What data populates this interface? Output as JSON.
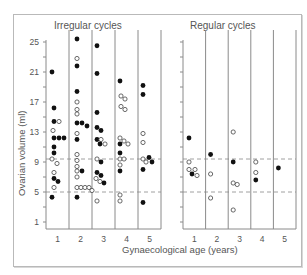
{
  "chart_data": {
    "type": "scatter",
    "ylabel": "Ovarian volume (ml)",
    "xlabel": "Gynaecological age (years)",
    "yticks": [
      1,
      5,
      9,
      13,
      17,
      21,
      25
    ],
    "ylim": [
      0,
      26
    ],
    "xticks": [
      1,
      2,
      3,
      4,
      5
    ],
    "reference_lines": [
      5,
      9.4
    ],
    "legend": {
      "filled": "filled circle",
      "open": "open circle"
    },
    "panels": [
      {
        "title": "Irregular cycles",
        "points": [
          {
            "x": 1,
            "dx": -3,
            "y": 21,
            "f": true
          },
          {
            "x": 1,
            "dx": -1,
            "y": 16.2,
            "f": true
          },
          {
            "x": 1,
            "dx": -1,
            "y": 14.4,
            "f": true
          },
          {
            "x": 1,
            "dx": 4,
            "y": 14.4,
            "f": false
          },
          {
            "x": 1,
            "dx": -2,
            "y": 13.2,
            "f": false
          },
          {
            "x": 1,
            "dx": -1,
            "y": 12.2,
            "f": true
          },
          {
            "x": 1,
            "dx": 4,
            "y": 12.2,
            "f": true
          },
          {
            "x": 1,
            "dx": 9,
            "y": 12.2,
            "f": true
          },
          {
            "x": 1,
            "dx": -1,
            "y": 11,
            "f": true
          },
          {
            "x": 1,
            "dx": -1,
            "y": 10.2,
            "f": true
          },
          {
            "x": 1,
            "dx": -3,
            "y": 9.4,
            "f": false
          },
          {
            "x": 1,
            "dx": 2,
            "y": 8.8,
            "f": false
          },
          {
            "x": 1,
            "dx": -1,
            "y": 7.6,
            "f": false
          },
          {
            "x": 1,
            "dx": -1,
            "y": 6.8,
            "f": true
          },
          {
            "x": 1,
            "dx": 3,
            "y": 6.4,
            "f": true
          },
          {
            "x": 1,
            "dx": -1,
            "y": 5.6,
            "f": false
          },
          {
            "x": 1,
            "dx": -3,
            "y": 4.3,
            "f": true
          },
          {
            "x": 2,
            "dx": -1,
            "y": 25.4,
            "f": true
          },
          {
            "x": 2,
            "dx": -1,
            "y": 22.8,
            "f": false
          },
          {
            "x": 2,
            "dx": -1,
            "y": 21.8,
            "f": true
          },
          {
            "x": 2,
            "dx": -1,
            "y": 18.4,
            "f": true
          },
          {
            "x": 2,
            "dx": -1,
            "y": 17,
            "f": false
          },
          {
            "x": 2,
            "dx": -1,
            "y": 16,
            "f": false
          },
          {
            "x": 2,
            "dx": -1,
            "y": 15.4,
            "f": false
          },
          {
            "x": 2,
            "dx": -1,
            "y": 14.2,
            "f": true
          },
          {
            "x": 2,
            "dx": 4,
            "y": 14.2,
            "f": true
          },
          {
            "x": 2,
            "dx": 9,
            "y": 13.8,
            "f": true
          },
          {
            "x": 2,
            "dx": -1,
            "y": 12.8,
            "f": false
          },
          {
            "x": 2,
            "dx": -1,
            "y": 12,
            "f": true
          },
          {
            "x": 2,
            "dx": -1,
            "y": 10,
            "f": false
          },
          {
            "x": 2,
            "dx": -1,
            "y": 9.2,
            "f": false
          },
          {
            "x": 2,
            "dx": -1,
            "y": 8.4,
            "f": false
          },
          {
            "x": 2,
            "dx": -1,
            "y": 7.8,
            "f": false
          },
          {
            "x": 2,
            "dx": 4,
            "y": 7.8,
            "f": true
          },
          {
            "x": 2,
            "dx": -1,
            "y": 7,
            "f": false
          },
          {
            "x": 2,
            "dx": -1,
            "y": 5.6,
            "f": false
          },
          {
            "x": 2,
            "dx": 3,
            "y": 5.6,
            "f": false
          },
          {
            "x": 2,
            "dx": 7,
            "y": 5.6,
            "f": false
          },
          {
            "x": 2,
            "dx": 11,
            "y": 5.6,
            "f": false
          },
          {
            "x": 2,
            "dx": 14,
            "y": 5.2,
            "f": false
          },
          {
            "x": 2,
            "dx": -1,
            "y": 4.3,
            "f": true
          },
          {
            "x": 3,
            "dx": -4,
            "y": 24.5,
            "f": true
          },
          {
            "x": 3,
            "dx": -4,
            "y": 20.8,
            "f": true
          },
          {
            "x": 3,
            "dx": -4,
            "y": 15.6,
            "f": true
          },
          {
            "x": 3,
            "dx": -4,
            "y": 13.6,
            "f": true
          },
          {
            "x": 3,
            "dx": 0,
            "y": 13.2,
            "f": true
          },
          {
            "x": 3,
            "dx": -4,
            "y": 12,
            "f": true
          },
          {
            "x": 3,
            "dx": 0,
            "y": 12,
            "f": false
          },
          {
            "x": 3,
            "dx": -1,
            "y": 11.4,
            "f": true
          },
          {
            "x": 3,
            "dx": 4,
            "y": 11.4,
            "f": false
          },
          {
            "x": 3,
            "dx": -4,
            "y": 9.4,
            "f": false
          },
          {
            "x": 3,
            "dx": 0,
            "y": 9,
            "f": true
          },
          {
            "x": 3,
            "dx": -4,
            "y": 7.6,
            "f": true
          },
          {
            "x": 3,
            "dx": 0,
            "y": 7.2,
            "f": true
          },
          {
            "x": 3,
            "dx": -5,
            "y": 6.8,
            "f": false
          },
          {
            "x": 3,
            "dx": -1,
            "y": 6.4,
            "f": false
          },
          {
            "x": 3,
            "dx": 3,
            "y": 6.2,
            "f": true
          },
          {
            "x": 3,
            "dx": -4,
            "y": 3.8,
            "f": false
          },
          {
            "x": 4,
            "dx": -4,
            "y": 19.8,
            "f": true
          },
          {
            "x": 4,
            "dx": -3,
            "y": 17.8,
            "f": false
          },
          {
            "x": 4,
            "dx": 1,
            "y": 17.4,
            "f": false
          },
          {
            "x": 4,
            "dx": -3,
            "y": 16.4,
            "f": false
          },
          {
            "x": 4,
            "dx": 1,
            "y": 16,
            "f": false
          },
          {
            "x": 4,
            "dx": -4,
            "y": 12.2,
            "f": false
          },
          {
            "x": 4,
            "dx": -4,
            "y": 11.4,
            "f": true
          },
          {
            "x": 4,
            "dx": 0,
            "y": 11.8,
            "f": false
          },
          {
            "x": 4,
            "dx": 4,
            "y": 11.4,
            "f": false
          },
          {
            "x": 4,
            "dx": -4,
            "y": 10.2,
            "f": true
          },
          {
            "x": 4,
            "dx": -4,
            "y": 9.4,
            "f": false
          },
          {
            "x": 4,
            "dx": 0,
            "y": 9.4,
            "f": false
          },
          {
            "x": 4,
            "dx": -4,
            "y": 8.6,
            "f": false
          },
          {
            "x": 4,
            "dx": -4,
            "y": 7.8,
            "f": true
          },
          {
            "x": 4,
            "dx": -4,
            "y": 4.6,
            "f": false
          },
          {
            "x": 4,
            "dx": -4,
            "y": 3.8,
            "f": false
          },
          {
            "x": 5,
            "dx": -4,
            "y": 19.2,
            "f": true
          },
          {
            "x": 5,
            "dx": -4,
            "y": 18,
            "f": true
          },
          {
            "x": 5,
            "dx": -4,
            "y": 12.8,
            "f": false
          },
          {
            "x": 5,
            "dx": -4,
            "y": 11.6,
            "f": false
          },
          {
            "x": 5,
            "dx": -4,
            "y": 9.4,
            "f": false
          },
          {
            "x": 5,
            "dx": -1,
            "y": 9,
            "f": false
          },
          {
            "x": 5,
            "dx": 2,
            "y": 9.6,
            "f": true
          },
          {
            "x": 5,
            "dx": 5,
            "y": 9,
            "f": true
          },
          {
            "x": 5,
            "dx": -4,
            "y": 8,
            "f": true
          },
          {
            "x": 5,
            "dx": -4,
            "y": 3.6,
            "f": true
          }
        ]
      },
      {
        "title": "Regular cycles",
        "points": [
          {
            "x": 1,
            "dx": -3,
            "y": 12.2,
            "f": true
          },
          {
            "x": 1,
            "dx": -3,
            "y": 9,
            "f": false
          },
          {
            "x": 1,
            "dx": -3,
            "y": 8,
            "f": false
          },
          {
            "x": 1,
            "dx": 3,
            "y": 8,
            "f": false
          },
          {
            "x": 1,
            "dx": 0,
            "y": 7.4,
            "f": true
          },
          {
            "x": 1,
            "dx": 5,
            "y": 7.2,
            "f": false
          },
          {
            "x": 2,
            "dx": -4,
            "y": 10,
            "f": true
          },
          {
            "x": 2,
            "dx": -4,
            "y": 7.4,
            "f": false
          },
          {
            "x": 2,
            "dx": -4,
            "y": 4.2,
            "f": false
          },
          {
            "x": 3,
            "dx": -4,
            "y": 13,
            "f": false
          },
          {
            "x": 3,
            "dx": -4,
            "y": 9,
            "f": true
          },
          {
            "x": 3,
            "dx": -4,
            "y": 6.2,
            "f": false
          },
          {
            "x": 3,
            "dx": 0,
            "y": 6,
            "f": false
          },
          {
            "x": 3,
            "dx": -4,
            "y": 2.6,
            "f": false
          },
          {
            "x": 4,
            "dx": -4,
            "y": 9,
            "f": false
          },
          {
            "x": 4,
            "dx": -4,
            "y": 7.6,
            "f": false
          },
          {
            "x": 4,
            "dx": -4,
            "y": 6.6,
            "f": true
          },
          {
            "x": 5,
            "dx": -4,
            "y": 8.2,
            "f": true
          }
        ]
      }
    ]
  },
  "labels": {
    "panel_left_title": "Irregular cycles",
    "panel_right_title": "Regular cycles",
    "y_axis": "Ovarian volume (ml)",
    "x_axis": "Gynaecological age (years)"
  }
}
